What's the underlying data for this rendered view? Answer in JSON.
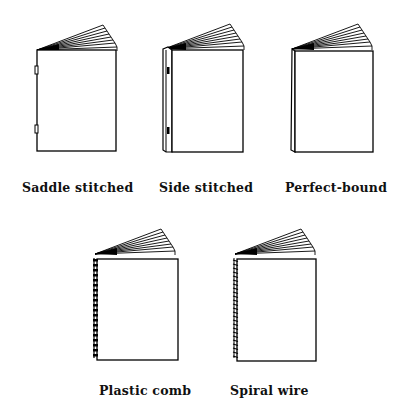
{
  "diagram": {
    "bindings": [
      {
        "id": "saddle",
        "label": "Saddle stitched"
      },
      {
        "id": "side",
        "label": "Side stitched"
      },
      {
        "id": "perfect",
        "label": "Perfect-bound"
      },
      {
        "id": "comb",
        "label": "Plastic comb"
      },
      {
        "id": "spiral",
        "label": "Spiral wire"
      }
    ]
  }
}
